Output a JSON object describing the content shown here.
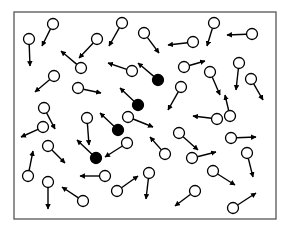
{
  "diagram": {
    "title": "",
    "container": {
      "x": 14,
      "y": 12,
      "width": 262,
      "height": 207,
      "stroke": "#555555"
    },
    "colors": {
      "open_fill": "#ffffff",
      "filled_fill": "#000000",
      "stroke": "#000000"
    },
    "particle_radius": 5.5,
    "particles": [
      {
        "cx": 29,
        "cy": 39,
        "tx": 30,
        "ty": 66,
        "filled": false
      },
      {
        "cx": 53,
        "cy": 24,
        "tx": 42,
        "ty": 46,
        "filled": false
      },
      {
        "cx": 81,
        "cy": 68,
        "tx": 61,
        "ty": 51,
        "filled": false
      },
      {
        "cx": 97,
        "cy": 39,
        "tx": 79,
        "ty": 58,
        "filled": false
      },
      {
        "cx": 54,
        "cy": 76,
        "tx": 35,
        "ty": 92,
        "filled": false
      },
      {
        "cx": 78,
        "cy": 88,
        "tx": 101,
        "ty": 93,
        "filled": false
      },
      {
        "cx": 122,
        "cy": 23,
        "tx": 109,
        "ty": 46,
        "filled": false
      },
      {
        "cx": 144,
        "cy": 33,
        "tx": 159,
        "ty": 53,
        "filled": false
      },
      {
        "cx": 193,
        "cy": 42,
        "tx": 168,
        "ty": 45,
        "filled": false
      },
      {
        "cx": 252,
        "cy": 34,
        "tx": 227,
        "ty": 35,
        "filled": false
      },
      {
        "cx": 214,
        "cy": 23,
        "tx": 207,
        "ty": 46,
        "filled": false
      },
      {
        "cx": 132,
        "cy": 71,
        "tx": 108,
        "ty": 63,
        "filled": false
      },
      {
        "cx": 158,
        "cy": 80,
        "tx": 138,
        "ty": 63,
        "filled": true
      },
      {
        "cx": 184,
        "cy": 67,
        "tx": 205,
        "ty": 61,
        "filled": false
      },
      {
        "cx": 210,
        "cy": 72,
        "tx": 220,
        "ty": 95,
        "filled": false
      },
      {
        "cx": 239,
        "cy": 63,
        "tx": 236,
        "ty": 90,
        "filled": false
      },
      {
        "cx": 251,
        "cy": 79,
        "tx": 263,
        "ty": 100,
        "filled": false
      },
      {
        "cx": 181,
        "cy": 87,
        "tx": 168,
        "ty": 110,
        "filled": false
      },
      {
        "cx": 138,
        "cy": 105,
        "tx": 120,
        "ty": 88,
        "filled": true
      },
      {
        "cx": 44,
        "cy": 108,
        "tx": 55,
        "ty": 129,
        "filled": false
      },
      {
        "cx": 43,
        "cy": 127,
        "tx": 21,
        "ty": 137,
        "filled": false
      },
      {
        "cx": 87,
        "cy": 118,
        "tx": 89,
        "ty": 145,
        "filled": false
      },
      {
        "cx": 118,
        "cy": 130,
        "tx": 100,
        "ty": 113,
        "filled": true
      },
      {
        "cx": 128,
        "cy": 117,
        "tx": 153,
        "ty": 127,
        "filled": false
      },
      {
        "cx": 127,
        "cy": 143,
        "tx": 105,
        "ty": 157,
        "filled": false
      },
      {
        "cx": 96,
        "cy": 158,
        "tx": 77,
        "ty": 140,
        "filled": true
      },
      {
        "cx": 217,
        "cy": 119,
        "tx": 193,
        "ty": 116,
        "filled": false
      },
      {
        "cx": 230,
        "cy": 116,
        "tx": 225,
        "ty": 95,
        "filled": false
      },
      {
        "cx": 179,
        "cy": 133,
        "tx": 198,
        "ty": 150,
        "filled": false
      },
      {
        "cx": 165,
        "cy": 154,
        "tx": 150,
        "ty": 137,
        "filled": false
      },
      {
        "cx": 192,
        "cy": 158,
        "tx": 216,
        "ty": 152,
        "filled": false
      },
      {
        "cx": 231,
        "cy": 138,
        "tx": 256,
        "ty": 137,
        "filled": false
      },
      {
        "cx": 247,
        "cy": 153,
        "tx": 253,
        "ty": 177,
        "filled": false
      },
      {
        "cx": 213,
        "cy": 171,
        "tx": 235,
        "ty": 185,
        "filled": false
      },
      {
        "cx": 233,
        "cy": 208,
        "tx": 256,
        "ty": 193,
        "filled": false
      },
      {
        "cx": 195,
        "cy": 191,
        "tx": 175,
        "ty": 206,
        "filled": false
      },
      {
        "cx": 149,
        "cy": 173,
        "tx": 146,
        "ty": 199,
        "filled": false
      },
      {
        "cx": 117,
        "cy": 191,
        "tx": 138,
        "ty": 176,
        "filled": false
      },
      {
        "cx": 105,
        "cy": 176,
        "tx": 80,
        "ty": 176,
        "filled": false
      },
      {
        "cx": 48,
        "cy": 146,
        "tx": 65,
        "ty": 163,
        "filled": false
      },
      {
        "cx": 28,
        "cy": 176,
        "tx": 33,
        "ty": 151,
        "filled": false
      },
      {
        "cx": 48,
        "cy": 182,
        "tx": 48,
        "ty": 209,
        "filled": false
      },
      {
        "cx": 83,
        "cy": 201,
        "tx": 62,
        "ty": 187,
        "filled": false
      }
    ]
  }
}
